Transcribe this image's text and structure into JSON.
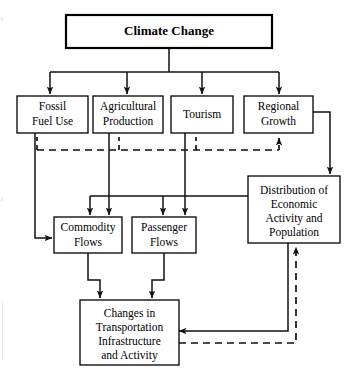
{
  "diagram": {
    "type": "flowchart",
    "nodes": {
      "climate_change": {
        "label": "Climate Change",
        "lines": [
          "Climate Change"
        ]
      },
      "fossil_fuel_use": {
        "label": "Fossil Fuel Use",
        "lines": [
          "Fossil",
          "Fuel Use"
        ]
      },
      "agricultural_production": {
        "label": "Agricultural Production",
        "lines": [
          "Agricultural",
          "Production"
        ]
      },
      "tourism": {
        "label": "Tourism",
        "lines": [
          "Tourism"
        ]
      },
      "regional_growth": {
        "label": "Regional Growth",
        "lines": [
          "Regional",
          "Growth"
        ]
      },
      "distribution": {
        "label": "Distribution of Economic Activity and Population",
        "lines": [
          "Distribution of",
          "Economic",
          "Activity and",
          "Population"
        ]
      },
      "commodity_flows": {
        "label": "Commodity Flows",
        "lines": [
          "Commodity",
          "Flows"
        ]
      },
      "passenger_flows": {
        "label": "Passenger Flows",
        "lines": [
          "Passenger",
          "Flows"
        ]
      },
      "changes_transportation": {
        "label": "Changes in Transportation Infrastructure and Activity",
        "lines": [
          "Changes in",
          "Transportation",
          "Infrastructure",
          "and Activity"
        ]
      }
    },
    "edges": [
      {
        "from": "climate_change",
        "to": "fossil_fuel_use",
        "style": "solid"
      },
      {
        "from": "climate_change",
        "to": "agricultural_production",
        "style": "solid"
      },
      {
        "from": "climate_change",
        "to": "tourism",
        "style": "solid"
      },
      {
        "from": "climate_change",
        "to": "regional_growth",
        "style": "solid"
      },
      {
        "from": "fossil_fuel_use",
        "to": "commodity_flows",
        "style": "solid"
      },
      {
        "from": "agricultural_production",
        "to": "commodity_flows",
        "style": "solid"
      },
      {
        "from": "tourism",
        "to": "passenger_flows",
        "style": "solid"
      },
      {
        "from": "regional_growth",
        "to": "distribution",
        "style": "solid"
      },
      {
        "from": "distribution",
        "to": "commodity_flows",
        "style": "solid"
      },
      {
        "from": "distribution",
        "to": "passenger_flows",
        "style": "solid"
      },
      {
        "from": "commodity_flows",
        "to": "changes_transportation",
        "style": "solid"
      },
      {
        "from": "passenger_flows",
        "to": "changes_transportation",
        "style": "solid"
      },
      {
        "from": "distribution",
        "to": "changes_transportation",
        "style": "solid"
      },
      {
        "from": "changes_transportation",
        "to": "distribution",
        "style": "dashed"
      },
      {
        "from": "changes_transportation",
        "to": "regional_growth",
        "style": "dashed"
      }
    ],
    "colors": {
      "box_fill": "#ffffff",
      "box_stroke": "#000000",
      "edge_stroke": "#111111",
      "background": "#ffffff"
    }
  }
}
